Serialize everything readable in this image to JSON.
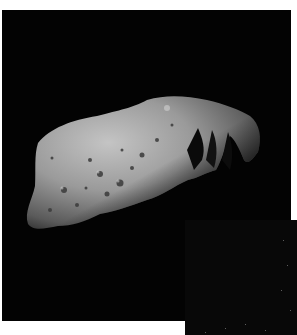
{
  "image": {
    "subject": "asteroid",
    "description": "Grayscale photograph of an elongated, cratered asteroid against a black background",
    "colors": {
      "background": "#030303",
      "surface_light": "#bdbdbd",
      "surface_mid": "#8a8a8a",
      "surface_dark": "#4a4a4a",
      "page": "#ffffff"
    }
  },
  "inset": {
    "description": "Partial second black image panel with faint speckles at lower right"
  }
}
